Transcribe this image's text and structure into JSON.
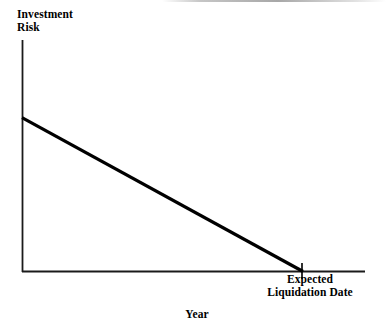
{
  "chart_data": {
    "type": "line",
    "title": "",
    "subtitle": "",
    "ylabel": "Investment Risk",
    "ylabel_lines": [
      "Investment",
      "Risk"
    ],
    "xlabel": "Year",
    "grid": false,
    "legend": false,
    "legend_position": "none",
    "axis_tick_labels_x": [],
    "axis_tick_labels_y": [],
    "xlim": [
      0,
      1.225
    ],
    "ylim": [
      0,
      1
    ],
    "series": [
      {
        "name": "Investment Risk over Time",
        "x": [
          0,
          1
        ],
        "y": [
          0.665,
          0
        ]
      }
    ],
    "annotations": [
      {
        "name": "expected-liquidation-date",
        "x": 1,
        "y": 0,
        "lines": [
          "Expected",
          "Liquidation Date"
        ],
        "text": "Expected Liquidation Date",
        "tick": true
      }
    ],
    "colors": {
      "background": "#ffffff",
      "axis": "#1a1a1a",
      "line": "#000000",
      "text": "#000000"
    }
  },
  "labels": {
    "y_axis_line1": "Investment",
    "y_axis_line2": "Risk",
    "x_axis": "Year",
    "annotation_line1": "Expected",
    "annotation_line2": "Liquidation Date"
  }
}
